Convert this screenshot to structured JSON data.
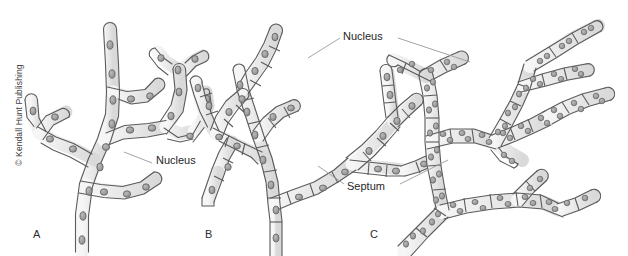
{
  "figure": {
    "width": 628,
    "height": 256,
    "background_color": "#ffffff",
    "copyright": "© Kendall Hunt Publishing",
    "colors": {
      "hypha_fill": "#e9e9e9",
      "hypha_fill_light": "#f2f2f2",
      "outline": "#4a4a4a",
      "nucleus_fill": "#9a9a9a",
      "nucleus_outline": "#5a5a5a",
      "septum_line": "#5a5a5a",
      "leader_line": "#9a9a9a",
      "text": "#1f1f1f"
    }
  },
  "panels": [
    {
      "letter": "A",
      "name": "aseptate-coenocytic-hypha",
      "letter_x": 33,
      "letter_y": 234
    },
    {
      "letter": "B",
      "name": "septate-uninucleate-hypha",
      "letter_x": 205,
      "letter_y": 234
    },
    {
      "letter": "C",
      "name": "septate-multinucleate-hypha",
      "letter_x": 370,
      "letter_y": 234
    }
  ],
  "labels": [
    {
      "id": "nucleus-a",
      "text": "Nucleus",
      "x": 156,
      "y": 160
    },
    {
      "id": "nucleus-bc",
      "text": "Nucleus",
      "x": 343,
      "y": 36
    },
    {
      "id": "septum-bc",
      "text": "Septum",
      "x": 347,
      "y": 186
    }
  ],
  "leader_lines": [
    {
      "id": "leader-nucleus-a",
      "x1": 124,
      "y1": 152,
      "x2": 152,
      "y2": 163
    },
    {
      "id": "leader-nucleus-b",
      "x1": 308,
      "y1": 58,
      "x2": 340,
      "y2": 38
    },
    {
      "id": "leader-nucleus-c",
      "x1": 398,
      "y1": 38,
      "x2": 470,
      "y2": 62
    },
    {
      "id": "leader-septum-b",
      "x1": 318,
      "y1": 166,
      "x2": 344,
      "y2": 184
    },
    {
      "id": "leader-septum-c",
      "x1": 400,
      "y1": 184,
      "x2": 448,
      "y2": 160
    }
  ]
}
